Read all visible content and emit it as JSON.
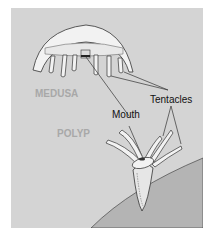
{
  "diagram": {
    "labels": {
      "medusa": "MEDUSA",
      "polyp": "POLYP",
      "mouth": "Mouth",
      "tentacles": "Tentacles"
    },
    "colors": {
      "background": "#d4d4d4",
      "ground": "#b4b4b4",
      "body_fill": "#f2f2f2",
      "outline": "#333333",
      "form_label": "#a8a8a8"
    }
  }
}
